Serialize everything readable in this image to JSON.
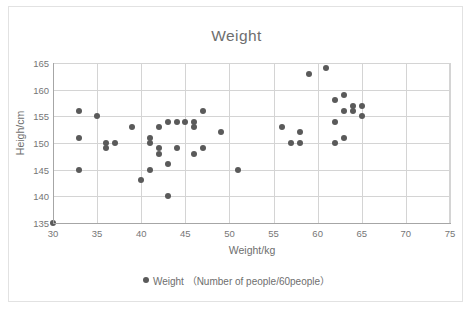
{
  "chart_data": {
    "type": "scatter",
    "title": "Weight",
    "xlabel": "Weight/kg",
    "ylabel": "Heigh/cm",
    "xlim": [
      30,
      75
    ],
    "ylim": [
      135,
      165
    ],
    "xticks": [
      30,
      35,
      40,
      45,
      50,
      55,
      60,
      65,
      70,
      75
    ],
    "yticks": [
      135,
      140,
      145,
      150,
      155,
      160,
      165
    ],
    "grid": true,
    "legend_position": "bottom",
    "series": [
      {
        "name": "Weight（Number of people/60people）",
        "marker_color": "#5a5a5a",
        "points": [
          [
            30,
            135
          ],
          [
            33,
            156
          ],
          [
            33,
            151
          ],
          [
            33,
            145
          ],
          [
            35,
            155
          ],
          [
            36,
            150
          ],
          [
            36,
            149
          ],
          [
            37,
            150
          ],
          [
            39,
            153
          ],
          [
            40,
            143
          ],
          [
            41,
            151
          ],
          [
            41,
            150
          ],
          [
            41,
            145
          ],
          [
            42,
            153
          ],
          [
            42,
            149
          ],
          [
            42,
            148
          ],
          [
            43,
            154
          ],
          [
            43,
            146
          ],
          [
            43,
            140
          ],
          [
            44,
            154
          ],
          [
            44,
            149
          ],
          [
            45,
            154
          ],
          [
            46,
            154
          ],
          [
            46,
            153
          ],
          [
            46,
            148
          ],
          [
            47,
            156
          ],
          [
            47,
            149
          ],
          [
            49,
            152
          ],
          [
            51,
            145
          ],
          [
            56,
            153
          ],
          [
            57,
            150
          ],
          [
            58,
            152
          ],
          [
            58,
            150
          ],
          [
            59,
            163
          ],
          [
            61,
            164
          ],
          [
            62,
            158
          ],
          [
            62,
            154
          ],
          [
            62,
            150
          ],
          [
            63,
            159
          ],
          [
            63,
            156
          ],
          [
            63,
            151
          ],
          [
            64,
            157
          ],
          [
            64,
            156
          ],
          [
            65,
            157
          ],
          [
            65,
            155
          ]
        ]
      }
    ]
  },
  "legend": {
    "marker_name": "legend-marker",
    "label": "Weight （Number of people/60people）"
  }
}
